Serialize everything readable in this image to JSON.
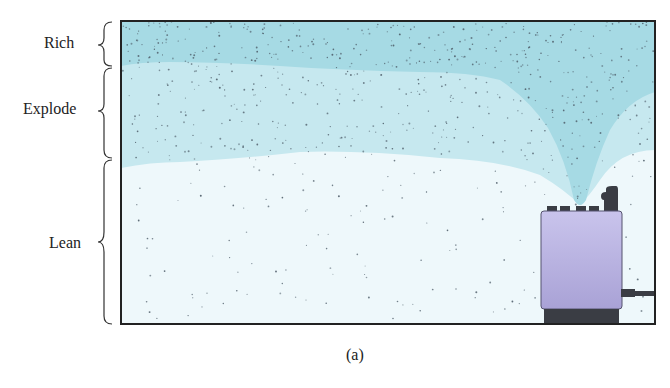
{
  "figure": {
    "caption": "(a)",
    "zones": [
      {
        "label": "Rich",
        "color": "#9fd6e0"
      },
      {
        "label": "Explode",
        "color": "#c4e7ee"
      },
      {
        "label": "Lean",
        "color": "#eaf6f9"
      }
    ],
    "source_object": "heater",
    "colors": {
      "frame": "#222222",
      "heater_body": "#b9b3e0",
      "heater_base": "#3a3d44",
      "plume": "#a8dbe5",
      "particles": "#4a5a66"
    }
  }
}
